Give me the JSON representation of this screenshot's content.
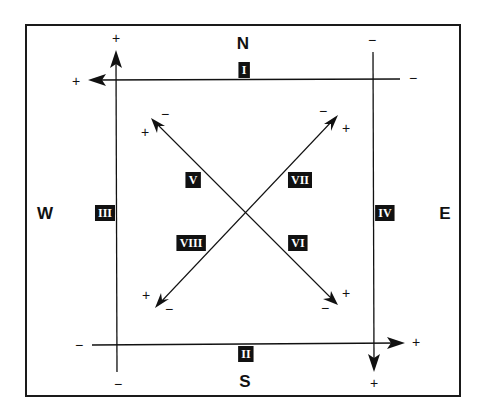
{
  "diagram": {
    "type": "directional-axis-diagram",
    "compass": {
      "north": "N",
      "south": "S",
      "west": "W",
      "east": "E"
    },
    "colors": {
      "line": "#111111",
      "badge_bg": "#111111",
      "badge_text": "#ffffff",
      "background": "#ffffff"
    },
    "axes": [
      {
        "id": "I",
        "label": "I",
        "orientation": "horizontal",
        "from": [
          400,
          80
        ],
        "to": [
          88,
          80
        ],
        "plus_end": "west",
        "minus_end": "east",
        "plus_label": "+",
        "minus_label": "−"
      },
      {
        "id": "II",
        "label": "II",
        "orientation": "horizontal",
        "from": [
          92,
          345
        ],
        "to": [
          405,
          343
        ],
        "plus_end": "east",
        "minus_end": "west",
        "plus_label": "+",
        "minus_label": "−"
      },
      {
        "id": "III",
        "label": "III",
        "orientation": "vertical",
        "from": [
          117,
          372
        ],
        "to": [
          116,
          50
        ],
        "plus_end": "north",
        "minus_end": "south",
        "plus_label": "+",
        "minus_label": "−"
      },
      {
        "id": "IV",
        "label": "IV",
        "orientation": "vertical",
        "from": [
          373,
          52
        ],
        "to": [
          374,
          372
        ],
        "plus_end": "south",
        "minus_end": "north",
        "plus_label": "+",
        "minus_label": "−"
      },
      {
        "id": "V",
        "label": "V",
        "orientation": "diagonal",
        "from": [
          245,
          210
        ],
        "to": [
          151,
          118
        ],
        "plus_end": "northwest",
        "plus_label": "+",
        "minus_label": "−"
      },
      {
        "id": "VI",
        "label": "VI",
        "orientation": "diagonal",
        "from": [
          245,
          210
        ],
        "to": [
          338,
          305
        ],
        "plus_end": "southeast",
        "plus_label": "+",
        "minus_label": "−"
      },
      {
        "id": "VII",
        "label": "VII",
        "orientation": "diagonal",
        "from": [
          245,
          210
        ],
        "to": [
          338,
          115
        ],
        "plus_end": "northeast",
        "plus_label": "+",
        "minus_label": "−"
      },
      {
        "id": "VIII",
        "label": "VIII",
        "orientation": "diagonal",
        "from": [
          245,
          210
        ],
        "to": [
          155,
          308
        ],
        "plus_end": "southwest",
        "plus_label": "+",
        "minus_label": "−"
      }
    ],
    "signs": {
      "plus": "+",
      "minus": "−"
    }
  }
}
